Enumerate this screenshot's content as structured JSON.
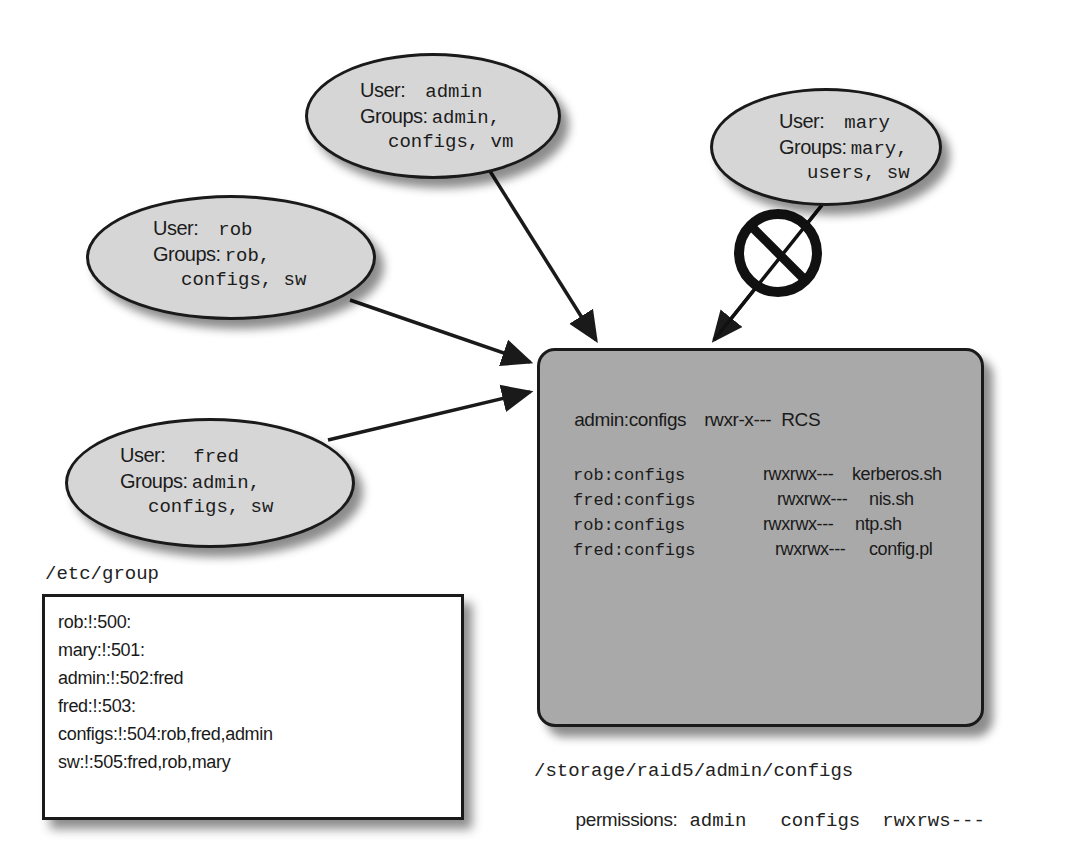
{
  "users": [
    {
      "id": "admin",
      "user_label": "User:",
      "user": "admin",
      "groups_label": "Groups:",
      "groups_line1": "admin,",
      "groups_line2": "configs, vm",
      "access": "allowed"
    },
    {
      "id": "mary",
      "user_label": "User:",
      "user": "mary",
      "groups_label": "Groups:",
      "groups_line1": "mary,",
      "groups_line2": "users, sw",
      "access": "denied"
    },
    {
      "id": "rob",
      "user_label": "User:",
      "user": "rob",
      "groups_label": "Groups:",
      "groups_line1": "rob,",
      "groups_line2": "configs, sw",
      "access": "allowed"
    },
    {
      "id": "fred",
      "user_label": "User:",
      "user": "fred",
      "groups_label": "Groups:",
      "groups_line1": "admin,",
      "groups_line2": "configs, sw",
      "access": "allowed"
    }
  ],
  "denied_icon": "prohibited-icon",
  "repository": {
    "header": {
      "owner": "admin:configs",
      "perm": "rwxr-x---",
      "name": "RCS"
    },
    "files": [
      {
        "owner": "rob:configs",
        "perm": "rwxrwx---",
        "name": "kerberos.sh"
      },
      {
        "owner": "fred:configs",
        "perm": "rwxrwx---",
        "name": "nis.sh"
      },
      {
        "owner": "rob:configs",
        "perm": "rwxrwx---",
        "name": "ntp.sh"
      },
      {
        "owner": "fred:configs",
        "perm": "rwxrwx---",
        "name": "config.pl"
      }
    ],
    "path": "/storage/raid5/admin/configs",
    "permissions_label": "permissions:",
    "perm_owner": "admin",
    "perm_group": "configs",
    "perm_mode": "rwxrws---"
  },
  "etc_group": {
    "title": "/etc/group",
    "lines": [
      "rob:!:500:",
      "mary:!:501:",
      "admin:!:502:fred",
      "fred:!:503:",
      "configs:!:504:rob,fred,admin",
      "sw:!:505:fred,rob,mary"
    ]
  },
  "colors": {
    "ellipse_fill": "#d6d6d6",
    "repo_fill": "#a9a9a9",
    "stroke": "#1a1a1a",
    "background": "#ffffff"
  }
}
